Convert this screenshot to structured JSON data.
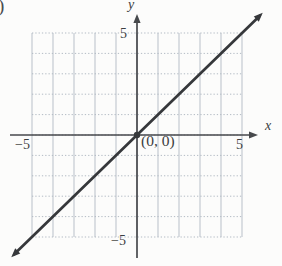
{
  "figure": {
    "problem_paren": ")",
    "labels": {
      "y_axis": "y",
      "x_axis": "x",
      "y_max": "5",
      "y_min": "−5",
      "x_min": "−5",
      "x_max": "5",
      "origin": "(0, 0)"
    }
  },
  "colors": {
    "background": "#fcfcfb",
    "grid": "#b9c0c9",
    "grid_dotted": "#b3bbc4",
    "axis": "#47494c",
    "line": "#36383b",
    "text": "#3c3e41"
  },
  "chart_data": {
    "type": "line",
    "title": "",
    "xlabel": "x",
    "ylabel": "y",
    "xlim": [
      -5,
      5
    ],
    "ylim": [
      -5,
      5
    ],
    "grid": true,
    "grid_step": 1,
    "legend": "none",
    "ticks": {
      "x": [
        -5,
        5
      ],
      "y": [
        -5,
        5
      ]
    },
    "series": [
      {
        "name": "y = x",
        "slope": 1,
        "intercept": 0,
        "points": [
          [
            -5,
            -5
          ],
          [
            0,
            0
          ],
          [
            5,
            5
          ]
        ],
        "arrow_both_ends": true
      }
    ],
    "marked_points": [
      [
        0,
        0
      ]
    ],
    "annotations": [
      {
        "text": "(0, 0)",
        "at": [
          0,
          0
        ]
      }
    ]
  }
}
